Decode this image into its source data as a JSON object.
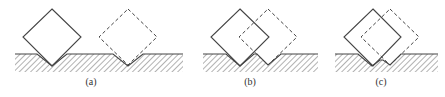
{
  "figure": {
    "colors": {
      "stroke": "#444444",
      "hatch": "#666666",
      "background": "#ffffff"
    },
    "panels": [
      {
        "id": "a",
        "label": "(a)",
        "label_pos": [
          91,
          85
        ],
        "ground": {
          "x": 15,
          "y": 54,
          "width": 168,
          "height": 18
        },
        "surface_path": "M15,54 L37,54 L52,66 L67,54 L113,54 L128,66 L143,54 L183,54",
        "solid_diamond": [
          [
            52,
            9
          ],
          [
            81,
            37
          ],
          [
            52,
            66
          ],
          [
            23,
            37
          ]
        ],
        "dashed_diamond": [
          [
            128,
            9
          ],
          [
            157,
            37
          ],
          [
            128,
            65
          ],
          [
            99,
            37
          ]
        ]
      },
      {
        "id": "b",
        "label": "(b)",
        "label_pos": [
          250,
          85
        ],
        "ground": {
          "x": 203,
          "y": 54,
          "width": 115,
          "height": 18
        },
        "surface_path": "M203,54 L226,54 L240,66 L254,54 L257,54 L268,65 L281,54 L318,54",
        "solid_diamond": [
          [
            240,
            9
          ],
          [
            269,
            37
          ],
          [
            240,
            66
          ],
          [
            211,
            37
          ]
        ],
        "dashed_diamond": [
          [
            268,
            9
          ],
          [
            297,
            37
          ],
          [
            268,
            65
          ],
          [
            239,
            37
          ]
        ]
      },
      {
        "id": "c",
        "label": "(c)",
        "label_pos": [
          381,
          85
        ],
        "ground": {
          "x": 335,
          "y": 54,
          "width": 103,
          "height": 18
        },
        "surface_path": "M335,54 L358,54 L372,66 L380,60 L383,60 L390,65 L401,54 L438,54",
        "solid_diamond": [
          [
            373,
            9
          ],
          [
            401,
            37
          ],
          [
            373,
            66
          ],
          [
            344,
            37
          ]
        ],
        "dashed_diamond": [
          [
            390,
            9
          ],
          [
            419,
            37
          ],
          [
            390,
            65
          ],
          [
            361,
            37
          ]
        ]
      }
    ]
  }
}
